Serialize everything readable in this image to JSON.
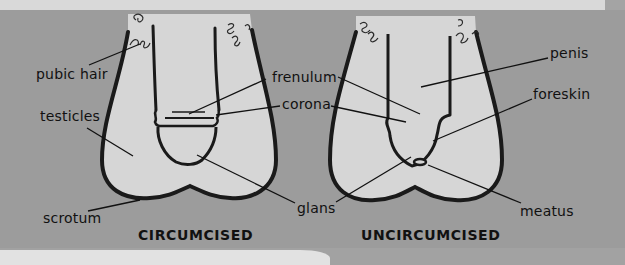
{
  "colors": {
    "background": "#9c9c9c",
    "top_strip": "#d9d9d9",
    "fill": "#d6d6d6",
    "outline": "#1a1a1a"
  },
  "diagrams": [
    {
      "caption": "CIRCUMCISED",
      "labels": {
        "pubic_hair": "pubic hair",
        "testicles": "testicles",
        "scrotum": "scrotum",
        "frenulum": "frenulum",
        "corona": "corona",
        "glans": "glans"
      }
    },
    {
      "caption": "UNCIRCUMCISED",
      "labels": {
        "penis": "penis",
        "foreskin": "foreskin",
        "meatus": "meatus"
      }
    }
  ]
}
